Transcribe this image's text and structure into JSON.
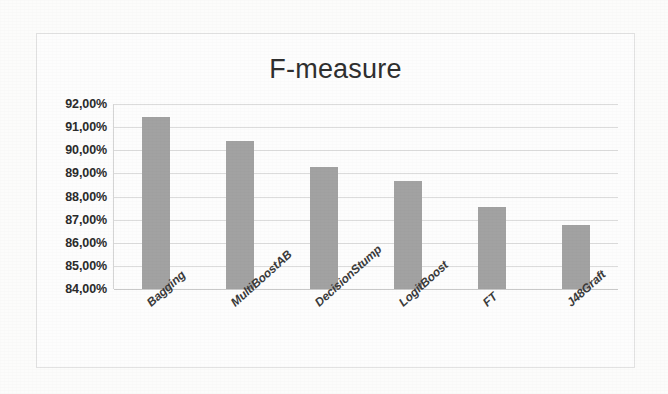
{
  "chart_data": {
    "type": "bar",
    "title": "F-measure",
    "xlabel": "",
    "ylabel": "",
    "categories": [
      "Bagging",
      "MultiBoostAB",
      "DecisionStump",
      "LogitBoost",
      "FT",
      "J48Graft"
    ],
    "values": [
      91.45,
      90.4,
      89.28,
      88.68,
      87.55,
      86.78
    ],
    "value_labels": [
      "91,45%",
      "90,40%",
      "89,28%",
      "88,68%",
      "87,55%",
      "86,78%"
    ],
    "ylim": [
      84.0,
      92.0
    ],
    "ytick_values": [
      92.0,
      91.0,
      90.0,
      89.0,
      88.0,
      87.0,
      86.0,
      85.0,
      84.0
    ],
    "ytick_labels": [
      "92,00%",
      "91,00%",
      "90,00%",
      "89,00%",
      "88,00%",
      "87,00%",
      "86,00%",
      "85,00%",
      "84,00%"
    ],
    "grid": true,
    "legend": false,
    "legend_position": "none",
    "series": [
      {
        "name": "F-measure",
        "values": [
          91.45,
          90.4,
          89.28,
          88.68,
          87.55,
          86.78
        ]
      }
    ],
    "colors": {
      "bar_fill": "#a2a2a2",
      "gridline": "#dcdcdc",
      "axis": "#c9c9c9",
      "title_text": "#2f2f2f",
      "tick_text": "#2b2b2b",
      "frame_border": "#e2e2e2",
      "background": "#fdfdfd"
    }
  }
}
